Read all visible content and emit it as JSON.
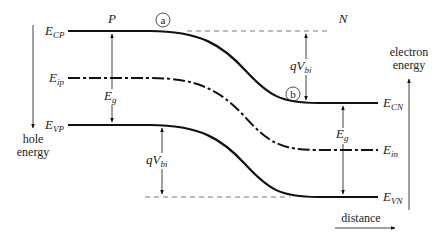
{
  "diagram": {
    "regions": {
      "p_label": "P",
      "n_label": "N"
    },
    "markers": {
      "a": "a",
      "b": "b"
    },
    "levels": {
      "ecp": {
        "main": "E",
        "sub": "CP"
      },
      "eip": {
        "main": "E",
        "sub": "ip"
      },
      "evp": {
        "main": "E",
        "sub": "VP"
      },
      "ecn": {
        "main": "E",
        "sub": "CN"
      },
      "ein": {
        "main": "E",
        "sub": "in"
      },
      "evn": {
        "main": "E",
        "sub": "VN"
      }
    },
    "annotations": {
      "eg_left": {
        "main": "E",
        "sub": "g"
      },
      "eg_right": {
        "main": "E",
        "sub": "g"
      },
      "qvbi_top": {
        "main": "qV",
        "sub": "bi"
      },
      "qvbi_bottom": {
        "main": "qV",
        "sub": "bi"
      }
    },
    "axes": {
      "hole_energy_line1": "hole",
      "hole_energy_line2": "energy",
      "electron_energy_line1": "electron",
      "electron_energy_line2": "energy",
      "distance": "distance"
    },
    "colors": {
      "line": "#111111",
      "text": "#222222",
      "dashed": "#555555"
    }
  }
}
